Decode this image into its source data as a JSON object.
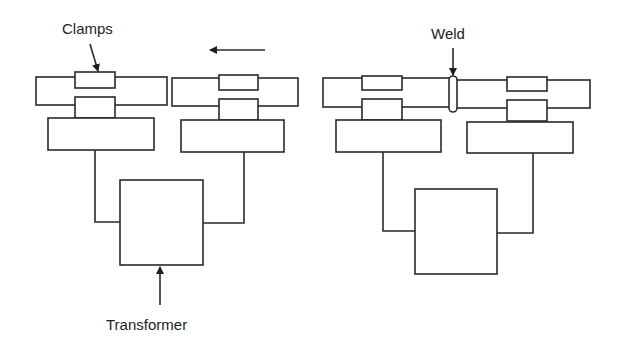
{
  "diagram": {
    "labels": {
      "clamps": "Clamps",
      "weld": "Weld",
      "transformer": "Transformer"
    },
    "panels": [
      {
        "id": "before",
        "description": "Two workpieces held in clamps, moving together (arrow pointing left)",
        "motion_arrow": "left"
      },
      {
        "id": "after",
        "description": "Workpieces joined with weld bead at the joint"
      }
    ],
    "colors": {
      "line": "#2a2a2a",
      "background": "#ffffff"
    }
  }
}
